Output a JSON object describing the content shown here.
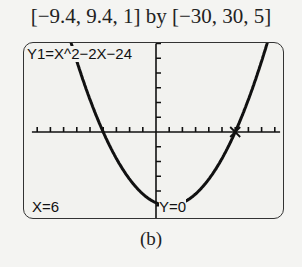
{
  "window": {
    "label": "[−9.4, 9.4, 1] by [−30, 30, 5]"
  },
  "screen": {
    "equation": "Y1=X^2−2X−24",
    "trace_x": "X=6",
    "trace_y": "Y=0"
  },
  "caption": "(b)",
  "chart_data": {
    "type": "line",
    "title": "Y1=X^2−2X−24",
    "function": "x^2 - 2x - 24",
    "xlim": [
      -9.4,
      9.4
    ],
    "ylim": [
      -30,
      30
    ],
    "xscl": 1,
    "yscl": 5,
    "trace_point": {
      "x": 6,
      "y": 0
    },
    "x": [
      -9.4,
      -8,
      -6,
      -4,
      -2,
      0,
      1,
      2,
      4,
      6,
      8,
      9.4
    ],
    "y": [
      81.16,
      56,
      24,
      0,
      -16,
      -24,
      -25,
      -24,
      -16,
      0,
      24,
      45.56
    ]
  },
  "colors": {
    "background": "#f4f4f2",
    "screen": "#f2f2ef",
    "ink": "#111111"
  }
}
